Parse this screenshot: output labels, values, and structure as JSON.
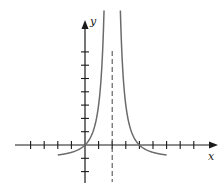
{
  "chart_data": {
    "type": "line",
    "title": "",
    "xlabel": "x",
    "ylabel": "y",
    "xlim": [
      -5.5,
      8.5
    ],
    "ylim": [
      -2.6,
      9
    ],
    "grid": false,
    "legend": null,
    "x_ticks": [
      -4,
      -3,
      -2,
      -1,
      1,
      2,
      3,
      4,
      5,
      6,
      7,
      8
    ],
    "y_ticks": [
      -2,
      -1,
      1,
      2,
      3,
      4,
      5,
      6,
      7
    ],
    "tick_labels_shown": false,
    "vertical_asymptote": {
      "x": 2,
      "style": "dashed"
    },
    "horizontal_asymptote": {
      "y": -1,
      "drawn": false
    },
    "zeros": [
      0,
      4
    ],
    "series": [
      {
        "name": "left-branch",
        "points": [
          [
            -2,
            -0.75
          ],
          [
            -1,
            -0.56
          ],
          [
            0,
            0
          ],
          [
            0.5,
            0.78
          ],
          [
            1,
            3
          ],
          [
            1.25,
            4.56
          ],
          [
            1.4,
            7.22
          ]
        ]
      },
      {
        "name": "right-branch",
        "points": [
          [
            2.6,
            7.22
          ],
          [
            2.75,
            4.56
          ],
          [
            3,
            3
          ],
          [
            3.5,
            0.78
          ],
          [
            4,
            0
          ],
          [
            5,
            -0.56
          ],
          [
            6,
            -0.75
          ]
        ]
      }
    ],
    "colors": {
      "curve": "#6b6b6b",
      "axes": "#1a1a1a",
      "asymptote": "#555555"
    }
  },
  "axes": {
    "x_label": "x",
    "y_label": "y"
  }
}
